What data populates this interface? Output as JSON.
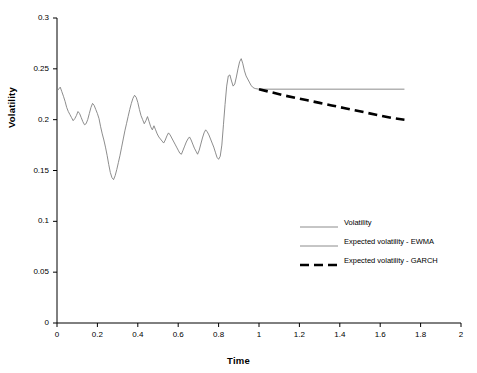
{
  "chart_data": {
    "type": "line",
    "title": "",
    "xlabel": "Time",
    "ylabel": "Volatility",
    "xlim": [
      0,
      2
    ],
    "ylim": [
      0,
      0.3
    ],
    "xticks": [
      "0",
      "0.2",
      "0.4",
      "0.6",
      "0.8",
      "1",
      "1.2",
      "1.4",
      "1.6",
      "1.8",
      "2"
    ],
    "yticks": [
      "0",
      "0.05",
      "0.1",
      "0.15",
      "0.2",
      "0.25",
      "0.3"
    ],
    "grid": false,
    "legend_position": "center-right",
    "legend": [
      {
        "name": "Volatility",
        "style": "thin-solid",
        "color": "#808080"
      },
      {
        "name": "Expected volatility - EWMA",
        "style": "thin-solid",
        "color": "#808080"
      },
      {
        "name": "Expected volatility - GARCH",
        "style": "thick-dashed",
        "color": "#000000"
      }
    ],
    "series": [
      {
        "name": "Volatility",
        "style": "thin-solid",
        "color": "#808080",
        "points": [
          [
            0.0,
            0.228
          ],
          [
            0.008,
            0.23
          ],
          [
            0.016,
            0.232
          ],
          [
            0.024,
            0.2275
          ],
          [
            0.032,
            0.223
          ],
          [
            0.04,
            0.218
          ],
          [
            0.048,
            0.212
          ],
          [
            0.056,
            0.208
          ],
          [
            0.064,
            0.205
          ],
          [
            0.072,
            0.202
          ],
          [
            0.08,
            0.199
          ],
          [
            0.088,
            0.201
          ],
          [
            0.096,
            0.204
          ],
          [
            0.104,
            0.208
          ],
          [
            0.112,
            0.206
          ],
          [
            0.12,
            0.202
          ],
          [
            0.128,
            0.198
          ],
          [
            0.136,
            0.195
          ],
          [
            0.144,
            0.196
          ],
          [
            0.152,
            0.2
          ],
          [
            0.16,
            0.206
          ],
          [
            0.168,
            0.212
          ],
          [
            0.176,
            0.216
          ],
          [
            0.184,
            0.214
          ],
          [
            0.192,
            0.21
          ],
          [
            0.2,
            0.206
          ],
          [
            0.208,
            0.201
          ],
          [
            0.216,
            0.193
          ],
          [
            0.224,
            0.186
          ],
          [
            0.232,
            0.18
          ],
          [
            0.24,
            0.173
          ],
          [
            0.248,
            0.165
          ],
          [
            0.256,
            0.156
          ],
          [
            0.264,
            0.148
          ],
          [
            0.272,
            0.143
          ],
          [
            0.28,
            0.141
          ],
          [
            0.288,
            0.145
          ],
          [
            0.296,
            0.151
          ],
          [
            0.304,
            0.158
          ],
          [
            0.312,
            0.165
          ],
          [
            0.32,
            0.173
          ],
          [
            0.328,
            0.181
          ],
          [
            0.336,
            0.189
          ],
          [
            0.344,
            0.196
          ],
          [
            0.352,
            0.203
          ],
          [
            0.36,
            0.21
          ],
          [
            0.368,
            0.216
          ],
          [
            0.376,
            0.221
          ],
          [
            0.384,
            0.224
          ],
          [
            0.392,
            0.222
          ],
          [
            0.4,
            0.217
          ],
          [
            0.408,
            0.21
          ],
          [
            0.416,
            0.204
          ],
          [
            0.424,
            0.2
          ],
          [
            0.432,
            0.196
          ],
          [
            0.44,
            0.199
          ],
          [
            0.448,
            0.203
          ],
          [
            0.456,
            0.198
          ],
          [
            0.464,
            0.193
          ],
          [
            0.472,
            0.19
          ],
          [
            0.48,
            0.194
          ],
          [
            0.488,
            0.19
          ],
          [
            0.496,
            0.186
          ],
          [
            0.504,
            0.183
          ],
          [
            0.512,
            0.181
          ],
          [
            0.52,
            0.179
          ],
          [
            0.528,
            0.177
          ],
          [
            0.536,
            0.18
          ],
          [
            0.544,
            0.184
          ],
          [
            0.552,
            0.187
          ],
          [
            0.56,
            0.185
          ],
          [
            0.568,
            0.182
          ],
          [
            0.576,
            0.179
          ],
          [
            0.584,
            0.176
          ],
          [
            0.592,
            0.173
          ],
          [
            0.6,
            0.17
          ],
          [
            0.608,
            0.167
          ],
          [
            0.616,
            0.166
          ],
          [
            0.624,
            0.17
          ],
          [
            0.632,
            0.174
          ],
          [
            0.64,
            0.178
          ],
          [
            0.648,
            0.181
          ],
          [
            0.656,
            0.183
          ],
          [
            0.664,
            0.18
          ],
          [
            0.672,
            0.176
          ],
          [
            0.68,
            0.172
          ],
          [
            0.688,
            0.169
          ],
          [
            0.696,
            0.166
          ],
          [
            0.704,
            0.17
          ],
          [
            0.712,
            0.176
          ],
          [
            0.72,
            0.182
          ],
          [
            0.728,
            0.187
          ],
          [
            0.736,
            0.19
          ],
          [
            0.744,
            0.188
          ],
          [
            0.752,
            0.185
          ],
          [
            0.76,
            0.181
          ],
          [
            0.768,
            0.177
          ],
          [
            0.776,
            0.173
          ],
          [
            0.784,
            0.168
          ],
          [
            0.792,
            0.163
          ],
          [
            0.8,
            0.161
          ],
          [
            0.808,
            0.164
          ],
          [
            0.816,
            0.175
          ],
          [
            0.824,
            0.195
          ],
          [
            0.832,
            0.215
          ],
          [
            0.84,
            0.233
          ],
          [
            0.848,
            0.243
          ],
          [
            0.856,
            0.244
          ],
          [
            0.864,
            0.238
          ],
          [
            0.872,
            0.233
          ],
          [
            0.88,
            0.235
          ],
          [
            0.888,
            0.242
          ],
          [
            0.896,
            0.25
          ],
          [
            0.904,
            0.257
          ],
          [
            0.912,
            0.26
          ],
          [
            0.92,
            0.255
          ],
          [
            0.928,
            0.248
          ],
          [
            0.936,
            0.243
          ],
          [
            0.944,
            0.24
          ],
          [
            0.952,
            0.237
          ],
          [
            0.96,
            0.234
          ],
          [
            0.968,
            0.232
          ],
          [
            0.976,
            0.231
          ],
          [
            0.984,
            0.2305
          ],
          [
            1.0,
            0.23
          ]
        ]
      },
      {
        "name": "Expected volatility - EWMA",
        "style": "thin-solid",
        "color": "#808080",
        "points": [
          [
            1.0,
            0.23
          ],
          [
            1.72,
            0.23
          ]
        ]
      },
      {
        "name": "Expected volatility - GARCH",
        "style": "thick-dashed",
        "color": "#000000",
        "points": [
          [
            1.0,
            0.23
          ],
          [
            1.06,
            0.227
          ],
          [
            1.12,
            0.224
          ],
          [
            1.18,
            0.2215
          ],
          [
            1.24,
            0.219
          ],
          [
            1.3,
            0.2165
          ],
          [
            1.36,
            0.214
          ],
          [
            1.42,
            0.2115
          ],
          [
            1.48,
            0.209
          ],
          [
            1.54,
            0.2065
          ],
          [
            1.6,
            0.204
          ],
          [
            1.66,
            0.2015
          ],
          [
            1.72,
            0.2
          ]
        ]
      }
    ]
  },
  "axes": {
    "x_title": "Time",
    "y_title": "Volatility"
  }
}
